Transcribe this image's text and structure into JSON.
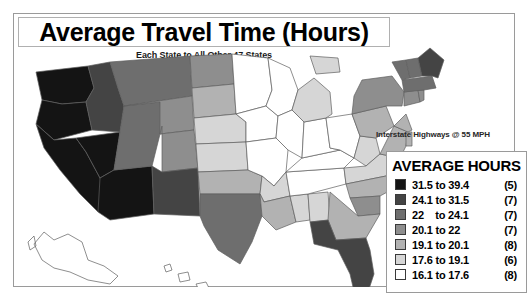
{
  "title": {
    "heading": "Average Travel Time (Hours)",
    "subtitle": "Each State to All Other 47 States"
  },
  "note": {
    "highways": "Interstate Highways @ 55 MPH"
  },
  "legend": {
    "heading": "AVERAGE HOURS",
    "rows": [
      {
        "range": "31.5 to 39.4",
        "count": "(5)",
        "color": "#141414"
      },
      {
        "range": "24.1 to 31.5",
        "count": "(7)",
        "color": "#444444"
      },
      {
        "range": "22    to 24.1",
        "count": "(7)",
        "color": "#6e6e6e"
      },
      {
        "range": "20.1 to 22",
        "count": "(7)",
        "color": "#8e8e8e"
      },
      {
        "range": "19.1 to 20.1",
        "count": "(8)",
        "color": "#b2b2b2"
      },
      {
        "range": "17.6 to 19.1",
        "count": "(6)",
        "color": "#d6d6d6"
      },
      {
        "range": "16.1 to 17.6",
        "count": "(8)",
        "color": "#ffffff"
      }
    ]
  },
  "chart_data": {
    "type": "map",
    "title": "Average Travel Time (Hours)",
    "subtitle": "Each State to All Other 47 States",
    "annotation": "Interstate Highways @ 55 MPH",
    "unit": "hours",
    "value_range": [
      16.1,
      39.4
    ],
    "class_breaks": [
      16.1,
      17.6,
      19.1,
      20.1,
      22,
      24.1,
      31.5,
      39.4
    ],
    "class_counts": [
      8,
      6,
      8,
      7,
      7,
      7,
      5
    ],
    "class_colors": [
      "#ffffff",
      "#d6d6d6",
      "#b2b2b2",
      "#8e8e8e",
      "#6e6e6e",
      "#444444",
      "#141414"
    ],
    "states": [
      {
        "code": "WA",
        "class": 1
      },
      {
        "code": "OR",
        "class": 1
      },
      {
        "code": "CA",
        "class": 1
      },
      {
        "code": "NV",
        "class": 1
      },
      {
        "code": "AZ",
        "class": 1
      },
      {
        "code": "ID",
        "class": 2
      },
      {
        "code": "MT",
        "class": 3
      },
      {
        "code": "UT",
        "class": 3
      },
      {
        "code": "WY",
        "class": 4
      },
      {
        "code": "NM",
        "class": 2
      },
      {
        "code": "CO",
        "class": 4
      },
      {
        "code": "ND",
        "class": 4
      },
      {
        "code": "SD",
        "class": 5
      },
      {
        "code": "NE",
        "class": 6
      },
      {
        "code": "KS",
        "class": 6
      },
      {
        "code": "OK",
        "class": 5
      },
      {
        "code": "TX",
        "class": 3
      },
      {
        "code": "MN",
        "class": 7
      },
      {
        "code": "IA",
        "class": 7
      },
      {
        "code": "MO",
        "class": 7
      },
      {
        "code": "AR",
        "class": 6
      },
      {
        "code": "LA",
        "class": 5
      },
      {
        "code": "WI",
        "class": 7
      },
      {
        "code": "IL",
        "class": 7
      },
      {
        "code": "MS",
        "class": 6
      },
      {
        "code": "AL",
        "class": 6
      },
      {
        "code": "TN",
        "class": 7
      },
      {
        "code": "KY",
        "class": 7
      },
      {
        "code": "IN",
        "class": 7
      },
      {
        "code": "MI",
        "class": 6
      },
      {
        "code": "OH",
        "class": 7
      },
      {
        "code": "WV",
        "class": 6
      },
      {
        "code": "VA",
        "class": 6
      },
      {
        "code": "NC",
        "class": 5
      },
      {
        "code": "SC",
        "class": 4
      },
      {
        "code": "GA",
        "class": 5
      },
      {
        "code": "FL",
        "class": 2
      },
      {
        "code": "PA",
        "class": 5
      },
      {
        "code": "NY",
        "class": 4
      },
      {
        "code": "MD",
        "class": 5
      },
      {
        "code": "DE",
        "class": 5
      },
      {
        "code": "NJ",
        "class": 5
      },
      {
        "code": "CT",
        "class": 4
      },
      {
        "code": "RI",
        "class": 4
      },
      {
        "code": "MA",
        "class": 3
      },
      {
        "code": "VT",
        "class": 3
      },
      {
        "code": "NH",
        "class": 3
      },
      {
        "code": "ME",
        "class": 2
      }
    ]
  }
}
